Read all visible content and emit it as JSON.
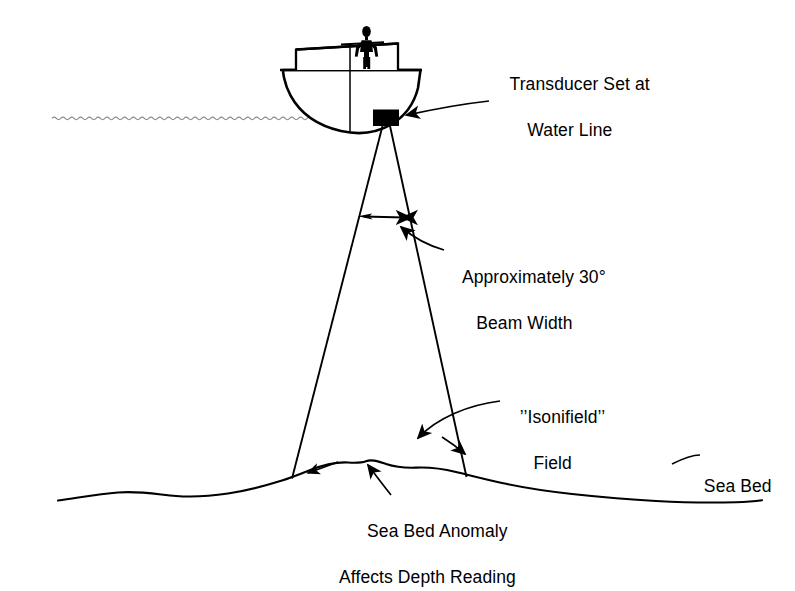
{
  "figure": {
    "background_color": "#ffffff",
    "ink_color": "#000000",
    "water_line_color": "#8a8a8a"
  },
  "labels": {
    "transducer": {
      "line1": "Transducer Set at",
      "line2": "Water Line"
    },
    "beam_width": {
      "line1": "Approximately 30°",
      "line2": "Beam Width"
    },
    "isonifield": {
      "line1": "’’Isonifield’’",
      "line2": "Field"
    },
    "sea_bed": {
      "line1": "Sea Bed"
    },
    "anomaly": {
      "line1": "Sea Bed Anomaly",
      "line2": "Affects Depth Reading"
    }
  },
  "annotations": {
    "beam_angle_degrees": 30,
    "icons": {
      "boat": "boat-icon",
      "person": "person-icon",
      "transducer": "transducer-icon",
      "water_line": "water-line-icon",
      "sea_bed": "sea-bed-icon",
      "beam": "sonar-beam-icon",
      "beam_width_arrow": "double-headed-arrow-icon",
      "leader_transducer": "leader-arrow-icon",
      "leader_beam": "leader-arrow-icon",
      "leader_isonifield_left": "leader-arrow-icon",
      "leader_isonifield_right": "leader-arrow-icon",
      "leader_anomaly": "leader-arrow-icon",
      "leader_sea_bed": "leader-arrow-icon",
      "beam_edge_arrow_left": "leader-arrow-icon"
    }
  }
}
